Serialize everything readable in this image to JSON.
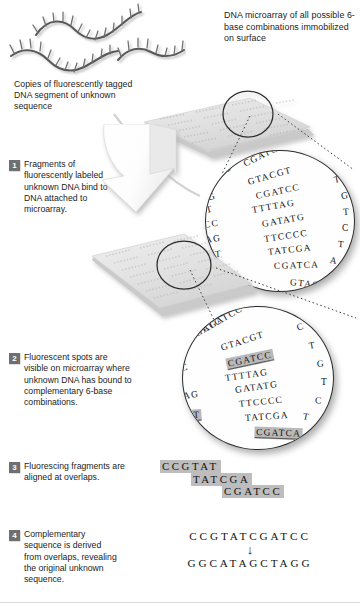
{
  "figure": {
    "title_note": "DNA microarray sequencing by hybridization diagram"
  },
  "labels": {
    "microarray_header": "DNA microarray of all possible 6-base combinations immobilized on surface",
    "copies_label": "Copies of fluorescently tagged DNA segment of unknown sequence"
  },
  "steps": [
    {
      "number": "1",
      "text": "Fragments of fluorescently labeled unknown DNA bind to DNA attached to microarray."
    },
    {
      "number": "2",
      "text": "Fluorescent spots are visible on microarray where unknown DNA has bound to complementary 6-base combinations."
    },
    {
      "number": "3",
      "text": "Fluorescing fragments are aligned at overlaps."
    },
    {
      "number": "4",
      "text": "Complementary sequence is derived from overlaps, revealing the original unknown sequence."
    }
  ],
  "magnifier_top": {
    "name": "unbound-microarray-closeup",
    "edge_left": [
      "CG",
      "G",
      "T",
      "CC",
      "AG",
      "AT",
      "CC",
      "GA",
      "C"
    ],
    "edge_right": [
      "C",
      "T",
      "G",
      "T",
      "C",
      "T",
      "A"
    ],
    "rows": [
      {
        "seq": "CGATCC",
        "lit": false
      },
      {
        "seq": "GTACGT",
        "lit": false
      },
      {
        "seq": "CGATCC",
        "lit": false
      },
      {
        "seq": "TTTTAG",
        "lit": false
      },
      {
        "seq": "GATATG",
        "lit": false
      },
      {
        "seq": "TTCCCC",
        "lit": false
      },
      {
        "seq": "TATCGA",
        "lit": false
      },
      {
        "seq": "CGATCA",
        "lit": false
      },
      {
        "seq": "GTACG",
        "lit": false
      }
    ]
  },
  "magnifier_bottom": {
    "name": "fluorescing-microarray-closeup",
    "edge_left": [
      "CGATC",
      "C",
      "AG",
      "TAT",
      "CC",
      "GA"
    ],
    "edge_right": [
      "C",
      "T",
      "G",
      "T",
      "C",
      "T"
    ],
    "rows": [
      {
        "seq": "CGATCC",
        "lit": false
      },
      {
        "seq": "GTACGT",
        "lit": false
      },
      {
        "seq": "CGATCC",
        "lit": true
      },
      {
        "seq": "TTTTAG",
        "lit": false
      },
      {
        "seq": "GATATG",
        "lit": false
      },
      {
        "seq": "TTCCCC",
        "lit": false
      },
      {
        "seq": "TATCGA",
        "lit": false
      },
      {
        "seq": "CGATCA",
        "lit": true
      },
      {
        "seq": "TAT",
        "lit": true
      }
    ]
  },
  "alignment": {
    "fragments": [
      {
        "seq": "CCGTAT",
        "offset_chars": 0
      },
      {
        "seq": "TATCGA",
        "offset_chars": 3
      },
      {
        "seq": "CGATCC",
        "offset_chars": 6
      }
    ]
  },
  "final": {
    "derived_sequence": "CCGTATCGATCC",
    "arrow_glyph": "↓",
    "complement_sequence": "GGCATAGCTAGG"
  },
  "colors": {
    "highlight_gray": "#bdbdbd",
    "badge_gray": "#6f6f6f",
    "text_black": "#1c1c1c",
    "plate_gray": "#e3e3e3"
  },
  "icons": {
    "dna_fragment": "dna-fragment-icon",
    "microarray_plate": "microarray-plate-icon",
    "magnifier_circle": "magnifier-circle-icon",
    "process_arrow": "downward-arrow-icon"
  }
}
